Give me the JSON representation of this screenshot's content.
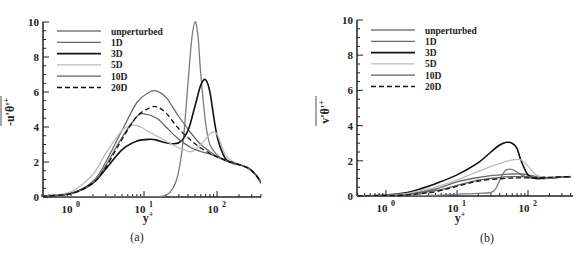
{
  "chart_data": [
    {
      "panel": "a",
      "type": "line",
      "caption": "(a)",
      "xlabel": "y+",
      "ylabel": "-u'θ'+",
      "xscale": "log",
      "xlim": [
        0.4,
        400
      ],
      "ylim": [
        0,
        10
      ],
      "yticks": [
        0,
        2,
        4,
        6,
        8,
        10
      ],
      "xticks": [
        "10^0",
        "10^1",
        "10^2"
      ],
      "legend_position": "upper-left",
      "grid": false,
      "series": [
        {
          "name": "unperturbed",
          "color": "#7a7a7a",
          "width": 1.3,
          "dash": "",
          "x": [
            0.4,
            1,
            5,
            10,
            15,
            20,
            25,
            30,
            35,
            40,
            45,
            50,
            55,
            60,
            70,
            80,
            100,
            130,
            170,
            220,
            280,
            350,
            400
          ],
          "y": [
            0.0,
            0.0,
            0.0,
            0.0,
            0.02,
            0.1,
            0.5,
            1.5,
            3.5,
            6.5,
            9.0,
            10.0,
            9.2,
            7.0,
            4.2,
            3.0,
            2.4,
            2.1,
            1.9,
            1.8,
            1.6,
            1.2,
            0.8
          ]
        },
        {
          "name": "1D",
          "color": "#6a6a6a",
          "width": 1.3,
          "dash": "",
          "x": [
            0.4,
            1,
            2,
            3,
            5,
            8,
            12,
            15,
            20,
            30,
            45,
            60,
            80,
            100,
            130,
            170,
            220,
            280,
            350,
            400
          ],
          "y": [
            0.05,
            0.2,
            0.9,
            2.0,
            3.8,
            5.4,
            6.0,
            6.05,
            5.7,
            4.6,
            3.6,
            3.0,
            2.6,
            2.3,
            2.1,
            1.95,
            1.8,
            1.6,
            1.2,
            0.8
          ]
        },
        {
          "name": "3D",
          "color": "#111111",
          "width": 1.6,
          "dash": "",
          "x": [
            0.4,
            1,
            2,
            3,
            5,
            8,
            12,
            15,
            20,
            30,
            40,
            50,
            60,
            70,
            80,
            100,
            130,
            170,
            220,
            280,
            350,
            400
          ],
          "y": [
            0.05,
            0.2,
            0.8,
            1.6,
            2.7,
            3.2,
            3.3,
            3.25,
            3.1,
            3.1,
            3.8,
            5.2,
            6.4,
            6.7,
            6.0,
            3.5,
            2.2,
            1.95,
            1.8,
            1.6,
            1.2,
            0.8
          ]
        },
        {
          "name": "5D",
          "color": "#bdbdbd",
          "width": 1.3,
          "dash": "",
          "x": [
            0.4,
            1,
            2,
            3,
            5,
            7,
            9,
            12,
            20,
            30,
            45,
            60,
            80,
            95,
            110,
            130,
            170,
            220,
            280,
            350,
            400
          ],
          "y": [
            0.05,
            0.3,
            1.3,
            2.5,
            3.8,
            4.1,
            4.0,
            3.7,
            3.2,
            2.8,
            2.6,
            3.0,
            3.6,
            3.7,
            3.2,
            2.4,
            2.0,
            1.8,
            1.6,
            1.2,
            0.8
          ]
        },
        {
          "name": "10D",
          "color": "#606060",
          "width": 1.3,
          "dash": "",
          "x": [
            0.4,
            1,
            2,
            3,
            5,
            8,
            10,
            15,
            20,
            30,
            45,
            60,
            80,
            100,
            130,
            170,
            220,
            280,
            350,
            400
          ],
          "y": [
            0.05,
            0.2,
            0.8,
            1.8,
            3.4,
            4.6,
            4.75,
            4.5,
            4.0,
            3.3,
            2.8,
            2.6,
            2.45,
            2.3,
            2.1,
            1.95,
            1.8,
            1.6,
            1.2,
            0.8
          ]
        },
        {
          "name": "20D",
          "color": "#111111",
          "width": 1.3,
          "dash": "5,3",
          "x": [
            0.4,
            1,
            2,
            3,
            5,
            8,
            12,
            15,
            20,
            30,
            45,
            60,
            80,
            100,
            130,
            170,
            220,
            280,
            350,
            400
          ],
          "y": [
            0.05,
            0.2,
            0.8,
            1.7,
            3.3,
            4.6,
            5.1,
            5.15,
            4.8,
            3.9,
            3.2,
            2.8,
            2.5,
            2.3,
            2.1,
            1.95,
            1.8,
            1.6,
            1.2,
            0.8
          ]
        }
      ]
    },
    {
      "panel": "b",
      "type": "line",
      "caption": "(b)",
      "xlabel": "y+",
      "ylabel": "v'θ'+",
      "xscale": "log",
      "xlim": [
        0.4,
        400
      ],
      "ylim": [
        0,
        10
      ],
      "yticks": [
        0,
        2,
        4,
        6,
        8,
        10
      ],
      "xticks": [
        "10^0",
        "10^1",
        "10^2"
      ],
      "legend_position": "upper-left",
      "grid": false,
      "series": [
        {
          "name": "unperturbed",
          "color": "#7a7a7a",
          "width": 1.3,
          "dash": "",
          "x": [
            0.4,
            1,
            3,
            10,
            20,
            30,
            35,
            40,
            45,
            50,
            60,
            70,
            80,
            100,
            130,
            170,
            250,
            400
          ],
          "y": [
            0.0,
            0.0,
            0.02,
            0.1,
            0.15,
            0.2,
            0.4,
            0.9,
            1.3,
            1.5,
            1.5,
            1.35,
            1.2,
            1.05,
            1.0,
            1.02,
            1.05,
            1.1
          ]
        },
        {
          "name": "1D",
          "color": "#6a6a6a",
          "width": 1.3,
          "dash": "",
          "x": [
            0.4,
            1,
            2,
            5,
            10,
            20,
            40,
            60,
            80,
            100,
            130,
            170,
            250,
            400
          ],
          "y": [
            0.0,
            0.03,
            0.1,
            0.4,
            0.8,
            1.05,
            1.2,
            1.25,
            1.25,
            1.2,
            1.1,
            1.05,
            1.05,
            1.1
          ]
        },
        {
          "name": "3D",
          "color": "#111111",
          "width": 1.6,
          "dash": "",
          "x": [
            0.4,
            1,
            2,
            3,
            5,
            10,
            20,
            30,
            40,
            50,
            60,
            70,
            80,
            100,
            130,
            170,
            250,
            400
          ],
          "y": [
            0.0,
            0.05,
            0.2,
            0.4,
            0.7,
            1.2,
            1.9,
            2.5,
            2.9,
            3.05,
            3.0,
            2.7,
            2.0,
            1.2,
            1.0,
            1.0,
            1.05,
            1.1
          ]
        },
        {
          "name": "5D",
          "color": "#bdbdbd",
          "width": 1.3,
          "dash": "",
          "x": [
            0.4,
            1,
            2,
            3,
            5,
            10,
            20,
            40,
            60,
            80,
            100,
            130,
            170,
            250,
            400
          ],
          "y": [
            0.0,
            0.04,
            0.15,
            0.3,
            0.5,
            0.9,
            1.4,
            1.85,
            2.05,
            2.05,
            1.7,
            1.2,
            1.05,
            1.05,
            1.1
          ]
        },
        {
          "name": "10D",
          "color": "#606060",
          "width": 1.3,
          "dash": "",
          "x": [
            0.4,
            1,
            2,
            5,
            10,
            20,
            40,
            60,
            80,
            100,
            130,
            170,
            250,
            400
          ],
          "y": [
            0.0,
            0.03,
            0.08,
            0.3,
            0.6,
            0.9,
            1.05,
            1.1,
            1.1,
            1.1,
            1.05,
            1.05,
            1.05,
            1.1
          ]
        },
        {
          "name": "20D",
          "color": "#111111",
          "width": 1.3,
          "dash": "5,3",
          "x": [
            0.4,
            1,
            2,
            5,
            10,
            20,
            40,
            60,
            80,
            100,
            130,
            170,
            250,
            400
          ],
          "y": [
            0.0,
            0.02,
            0.06,
            0.25,
            0.55,
            0.85,
            0.98,
            1.02,
            1.03,
            1.03,
            1.04,
            1.05,
            1.08,
            1.1
          ]
        }
      ]
    }
  ],
  "panels": [
    {
      "caption": "(a)",
      "ylabel": "-u'θ'",
      "ylabel_sup": "+",
      "xlabel": "y",
      "xlabel_sup": "+"
    },
    {
      "caption": "(b)",
      "ylabel": "v'θ'",
      "ylabel_sup": "+",
      "xlabel": "y",
      "xlabel_sup": "+"
    }
  ]
}
